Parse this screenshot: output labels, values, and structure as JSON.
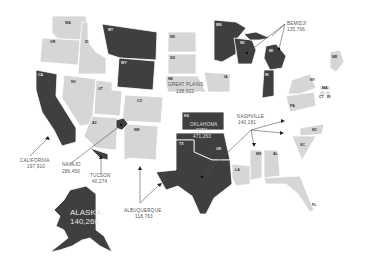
{
  "map": {
    "title": "",
    "colors": {
      "highlight": "#3f3f3f",
      "base": "#d6d6d6",
      "background": "#ffffff",
      "text": "#555555"
    },
    "state_labels": {
      "WA": "WA",
      "OR": "OR",
      "ID": "ID",
      "MT": "MT",
      "WY": "WY",
      "CA": "CA",
      "NV": "NV",
      "UT": "UT",
      "AZ": "AZ",
      "CO": "CO",
      "NM": "NM",
      "ND": "ND",
      "SD": "SD",
      "NE": "NE",
      "KS": "KS",
      "OK": "OK",
      "TX": "TX",
      "MN": "MN",
      "WI": "WI",
      "MI": "MI",
      "IN": "IN",
      "IA": "IA",
      "NY": "NY",
      "PA": "PA",
      "MA": "MA",
      "CT": "CT",
      "RI": "RI",
      "ME": "ME",
      "NC": "NC",
      "SC": "SC",
      "MS": "MS",
      "AL": "AL",
      "LA": "LA",
      "FL": "FL"
    },
    "highlighted_states": [
      "CA",
      "MT",
      "WY",
      "OK",
      "KS",
      "TX",
      "MN",
      "WI",
      "MI",
      "IN",
      "AK"
    ],
    "callouts": [
      {
        "name": "CALIFORNIA",
        "value": "197,910"
      },
      {
        "name": "NAVAJO",
        "value": "286,450"
      },
      {
        "name": "TUCSON",
        "value": "40,274"
      },
      {
        "name": "ALBUQUERQUE",
        "value": "118,763"
      },
      {
        "name": "OKLAHOMA",
        "name2": "CITY",
        "value": "471,263"
      },
      {
        "name": "GREAT PLAINS",
        "value": "138,022"
      },
      {
        "name": "BEMIDJI",
        "value": "135,766"
      },
      {
        "name": "NASHVILLE",
        "value": "140,181"
      },
      {
        "name": "ALASKA",
        "value": "140,260"
      }
    ]
  }
}
